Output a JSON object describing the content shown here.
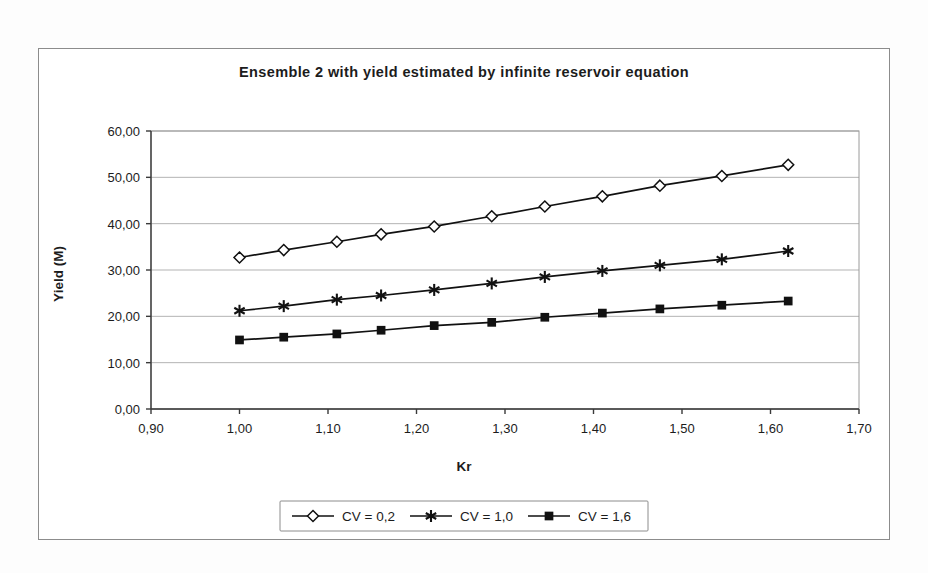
{
  "chart_data": {
    "type": "line",
    "title": "Ensemble 2 with yield estimated by infinite reservoir equation",
    "xlabel": "Kr",
    "ylabel": "Yield (M)",
    "xlim": [
      0.9,
      1.7
    ],
    "ylim": [
      0.0,
      60.0
    ],
    "xticks": [
      "0,90",
      "1,00",
      "1,10",
      "1,20",
      "1,30",
      "1,40",
      "1,50",
      "1,60",
      "1,70"
    ],
    "xtick_values": [
      0.9,
      1.0,
      1.1,
      1.2,
      1.3,
      1.4,
      1.5,
      1.6,
      1.7
    ],
    "yticks": [
      "0,00",
      "10,00",
      "20,00",
      "30,00",
      "40,00",
      "50,00",
      "60,00"
    ],
    "ytick_values": [
      0,
      10,
      20,
      30,
      40,
      50,
      60
    ],
    "grid": "horizontal",
    "legend_position": "bottom",
    "x": [
      1.0,
      1.05,
      1.11,
      1.16,
      1.22,
      1.285,
      1.345,
      1.41,
      1.475,
      1.545,
      1.62
    ],
    "series": [
      {
        "name": "CV = 0,2",
        "marker": "diamond",
        "values": [
          32.7,
          34.3,
          36.1,
          37.7,
          39.4,
          41.6,
          43.7,
          45.9,
          48.2,
          50.3,
          52.7
        ]
      },
      {
        "name": "CV = 1,0",
        "marker": "asterisk",
        "values": [
          21.2,
          22.2,
          23.6,
          24.5,
          25.7,
          27.1,
          28.5,
          29.8,
          31.0,
          32.3,
          34.1
        ]
      },
      {
        "name": "CV = 1,6",
        "marker": "square",
        "values": [
          14.9,
          15.5,
          16.2,
          17.0,
          18.0,
          18.7,
          19.8,
          20.7,
          21.6,
          22.4,
          23.3
        ]
      }
    ]
  },
  "colors": {
    "series_stroke": "#111111",
    "gridline": "#aaaaaa",
    "axis": "#3a3a3a",
    "frame": "#8c8c8c",
    "background": "#ffffff"
  }
}
